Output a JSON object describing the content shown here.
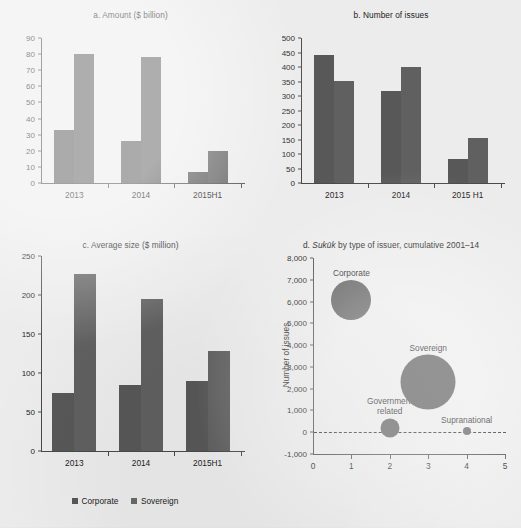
{
  "figure": {
    "background_color": "#ececec",
    "series_colors": {
      "corporate": "#585858",
      "sovereign": "#606060"
    }
  },
  "legend": {
    "items": [
      {
        "label": "Corporate",
        "color": "#585858",
        "swatch": "square-swatch"
      },
      {
        "label": "Sovereign",
        "color": "#6a6a6a",
        "swatch": "square-swatch"
      }
    ]
  },
  "chart_data": [
    {
      "type": "bar",
      "panel": "a",
      "title": "a. Amount ($ billion)",
      "xlabel": "",
      "ylabel": "",
      "categories": [
        "2013",
        "2014",
        "2015H1"
      ],
      "yticks": [
        0,
        10,
        20,
        30,
        40,
        50,
        60,
        70,
        80,
        90
      ],
      "ytick_labels": [
        "0",
        "10",
        "20",
        "30",
        "40",
        "50",
        "60",
        "70",
        "80",
        "90"
      ],
      "ylim": [
        0,
        90
      ],
      "grid": false,
      "legend_position": "below-figure",
      "series": [
        {
          "name": "Corporate",
          "values": [
            33,
            26,
            7
          ]
        },
        {
          "name": "Sovereign",
          "values": [
            80,
            78,
            20
          ]
        }
      ]
    },
    {
      "type": "bar",
      "panel": "b",
      "title": "b. Number of issues",
      "xlabel": "",
      "ylabel": "",
      "categories": [
        "2013",
        "2014",
        "2015 H1"
      ],
      "yticks": [
        0,
        50,
        100,
        150,
        200,
        250,
        300,
        350,
        400,
        450,
        500
      ],
      "ytick_labels": [
        "0",
        "50",
        "100",
        "150",
        "200",
        "250",
        "300",
        "350",
        "400",
        "450",
        "500"
      ],
      "ylim": [
        0,
        500
      ],
      "grid": false,
      "legend_position": "below-figure",
      "series": [
        {
          "name": "Corporate",
          "values": [
            440,
            318,
            82
          ]
        },
        {
          "name": "Sovereign",
          "values": [
            352,
            400,
            155
          ]
        }
      ]
    },
    {
      "type": "bar",
      "panel": "c",
      "title": "c. Average size ($ million)",
      "xlabel": "",
      "ylabel": "",
      "categories": [
        "2013",
        "2014",
        "2015H1"
      ],
      "yticks": [
        0,
        50,
        100,
        150,
        200,
        250
      ],
      "ytick_labels": [
        "0",
        "50",
        "100",
        "150",
        "200",
        "250"
      ],
      "ylim": [
        0,
        250
      ],
      "grid": false,
      "legend_position": "below-figure",
      "series": [
        {
          "name": "Corporate",
          "values": [
            75,
            84,
            90
          ]
        },
        {
          "name": "Sovereign",
          "values": [
            227,
            195,
            128
          ]
        }
      ]
    },
    {
      "type": "scatter",
      "panel": "d",
      "title_prefix": "d. ",
      "title_italic": "Sukūk",
      "title_suffix": " by type of issuer, cumulative 2001–14",
      "title": "d. Sukūk by type of issuer, cumulative 2001–14",
      "xlabel": "",
      "ylabel": "Number of issues",
      "xticks": [
        0,
        1,
        2,
        3,
        4,
        5
      ],
      "xtick_labels": [
        "0",
        "1",
        "2",
        "3",
        "4",
        "5"
      ],
      "xlim": [
        0,
        5
      ],
      "yticks": [
        -1000,
        0,
        1000,
        2000,
        3000,
        4000,
        5000,
        6000,
        7000,
        8000
      ],
      "ytick_labels": [
        "-1,000",
        "0",
        "1,000",
        "2,000",
        "3,000",
        "4,000",
        "5,000",
        "6,000",
        "7,000",
        "8,000"
      ],
      "ylim": [
        -1000,
        8000
      ],
      "grid": false,
      "reference_line_y": 0,
      "points": [
        {
          "label": "Corporate",
          "x": 1,
          "y": 6050,
          "size_px": 40
        },
        {
          "label": "Government related",
          "x": 2,
          "y": 200,
          "size_px": 19
        },
        {
          "label": "Sovereign",
          "x": 3,
          "y": 2300,
          "size_px": 55
        },
        {
          "label": "Supranational",
          "x": 4,
          "y": 50,
          "size_px": 8
        }
      ]
    }
  ]
}
